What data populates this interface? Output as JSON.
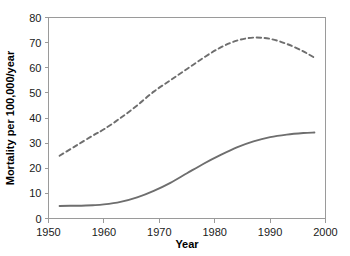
{
  "chart_data": {
    "type": "line",
    "title": "",
    "xlabel": "Year",
    "ylabel": "Mortality per 100,000/year",
    "xlim": [
      1950,
      2000
    ],
    "ylim": [
      0,
      80
    ],
    "xticks": [
      1950,
      1960,
      1970,
      1980,
      1990,
      2000
    ],
    "yticks": [
      0,
      10,
      20,
      30,
      40,
      50,
      60,
      70,
      80
    ],
    "grid": false,
    "legend": "none",
    "series": [
      {
        "name": "dashed-upper-series",
        "style": "dashed",
        "color": "#6e6e6e",
        "x": [
          1952,
          1955,
          1958,
          1960,
          1963,
          1966,
          1969,
          1972,
          1975,
          1978,
          1981,
          1984,
          1987,
          1990,
          1993,
          1996,
          1998
        ],
        "values": [
          25,
          29,
          33,
          35.5,
          40,
          45,
          50.5,
          55,
          59.5,
          64,
          68,
          70.8,
          72,
          71.5,
          69.5,
          66.5,
          64
        ]
      },
      {
        "name": "solid-lower-series",
        "style": "solid",
        "color": "#6e6e6e",
        "x": [
          1952,
          1955,
          1958,
          1960,
          1963,
          1966,
          1969,
          1972,
          1975,
          1978,
          1981,
          1984,
          1987,
          1990,
          1993,
          1996,
          1998
        ],
        "values": [
          5,
          5.1,
          5.3,
          5.6,
          6.6,
          8.4,
          11,
          14.2,
          18,
          21.8,
          25.2,
          28.3,
          30.7,
          32.4,
          33.4,
          34,
          34.2
        ]
      }
    ]
  },
  "axes": {
    "y_tick_labels": [
      "0",
      "10",
      "20",
      "30",
      "40",
      "50",
      "60",
      "70",
      "80"
    ],
    "x_tick_labels": [
      "1950",
      "1960",
      "1970",
      "1980",
      "1990",
      "2000"
    ],
    "x_title": "Year",
    "y_title": "Mortality per 100,000/year"
  }
}
